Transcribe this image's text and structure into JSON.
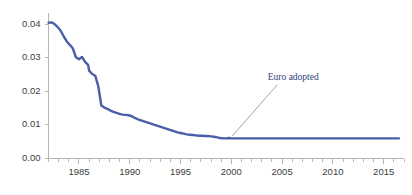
{
  "chart_data": {
    "type": "line",
    "title": "",
    "subtitle": "",
    "xlabel": "",
    "ylabel": "",
    "xlim": [
      1982,
      2017
    ],
    "ylim": [
      0.0,
      0.0425
    ],
    "grid": false,
    "legend": null,
    "y_tick_labels": [
      "0.00",
      "0.01",
      "0.02",
      "0.03",
      "0.04"
    ],
    "y_tick_values": [
      0.0,
      0.01,
      0.02,
      0.03,
      0.04
    ],
    "x_tick_labels": [
      "1985",
      "1990",
      "1995",
      "2000",
      "2005",
      "2010",
      "2015"
    ],
    "x_tick_values": [
      1985,
      1990,
      1995,
      2000,
      2005,
      2010,
      2015
    ],
    "x_minor_tick_step": 1,
    "series": [
      {
        "name": "exchange rate",
        "color": "#4a5fa5",
        "x": [
          1982.0,
          1982.3,
          1982.6,
          1982.9,
          1983.2,
          1983.5,
          1983.8,
          1984.1,
          1984.4,
          1984.7,
          1985.0,
          1985.3,
          1985.6,
          1985.9,
          1986.0,
          1986.3,
          1986.6,
          1986.9,
          1987.2,
          1987.5,
          1987.8,
          1988.1,
          1988.4,
          1988.7,
          1989.0,
          1989.3,
          1989.6,
          1989.9,
          1990.2,
          1990.5,
          1990.8,
          1991.1,
          1991.4,
          1991.7,
          1992.0,
          1992.3,
          1992.6,
          1992.9,
          1993.2,
          1993.5,
          1993.8,
          1994.1,
          1994.4,
          1994.7,
          1995.0,
          1995.3,
          1995.6,
          1995.9,
          1996.2,
          1996.5,
          1996.8,
          1997.1,
          1997.4,
          1997.7,
          1998.0,
          1998.3,
          1998.6,
          1998.9,
          1999.2,
          1999.5,
          1999.8,
          2000.0,
          2000.5,
          2001.0,
          2003.0,
          2005.0,
          2007.0,
          2009.0,
          2011.0,
          2013.0,
          2015.0,
          2016.5
        ],
        "y": [
          0.0405,
          0.0406,
          0.0401,
          0.0392,
          0.0381,
          0.0364,
          0.0349,
          0.0339,
          0.0328,
          0.0302,
          0.0296,
          0.0303,
          0.0288,
          0.0279,
          0.0262,
          0.0252,
          0.0247,
          0.0216,
          0.0158,
          0.0152,
          0.0148,
          0.0143,
          0.0139,
          0.0136,
          0.0133,
          0.0131,
          0.013,
          0.0129,
          0.0126,
          0.0121,
          0.0117,
          0.0114,
          0.0111,
          0.0108,
          0.0105,
          0.0102,
          0.0099,
          0.0096,
          0.0093,
          0.009,
          0.0087,
          0.0084,
          0.0081,
          0.0078,
          0.0076,
          0.0074,
          0.0072,
          0.0071,
          0.007,
          0.0069,
          0.0068,
          0.0068,
          0.0067,
          0.0067,
          0.0066,
          0.0065,
          0.0063,
          0.0061,
          0.006,
          0.006,
          0.0061,
          0.006,
          0.006,
          0.006,
          0.006,
          0.006,
          0.006,
          0.006,
          0.006,
          0.006,
          0.006,
          0.006
        ]
      }
    ],
    "annotations": [
      {
        "label": "Euro adopted",
        "x": 2000.0,
        "y": 0.006,
        "label_x": 2006.1,
        "label_y": 0.0235,
        "color": "#2f3f7a"
      }
    ],
    "colors": {
      "line": "#4a5fa5",
      "axis": "#b6b6b6",
      "tick_label": "#3d3d3d",
      "annotation": "#2f3f7a",
      "leader_line": "#8f96b8",
      "background": "#ffffff"
    }
  }
}
